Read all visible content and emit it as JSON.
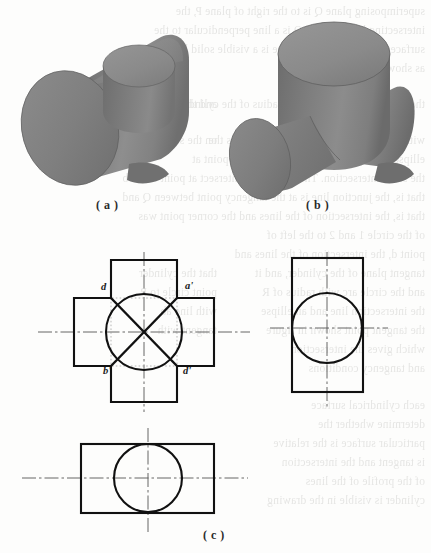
{
  "page": {
    "background_color": "#fdfdfc",
    "ink_color": "#1a1a1a",
    "bleed_text_color": "#6b6b66"
  },
  "figures": {
    "a": {
      "caption": "( a )",
      "description": "shaded-3d-solid-horizontal-cylinder-with-vertical-boss",
      "shading": {
        "top_face": "#8c8c8c",
        "light_side": "#939393",
        "mid_side": "#7d7d7d",
        "dark_side": "#6e6e6e",
        "edge": "#5f5f5f"
      }
    },
    "b": {
      "caption": "( b )",
      "description": "shaded-3d-solid-vertical-cylinder-with-through-horizontal-cylinder",
      "shading": {
        "top_face": "#8c8c8c",
        "light_side": "#939393",
        "mid_side": "#7d7d7d",
        "dark_side": "#6e6e6e",
        "edge": "#5f5f5f"
      }
    },
    "c": {
      "caption": "( c )",
      "description": "orthographic-three-view-projection-of-intersecting-cylinders",
      "views": {
        "front": {
          "name": "front-view-cross-shape-with-circle-and-intersection-curves",
          "point_labels": [
            {
              "text": "d",
              "x": 101,
              "y": 289
            },
            {
              "text": "a'",
              "x": 186,
              "y": 288
            },
            {
              "text": "b'",
              "x": 104,
              "y": 373
            },
            {
              "text": "d'",
              "x": 184,
              "y": 373
            }
          ]
        },
        "side": {
          "name": "side-view-rectangle-with-circle"
        },
        "top": {
          "name": "top-view-rectangle-with-circle"
        }
      }
    }
  },
  "bleed_lines": [
    {
      "x": 6,
      "y": 2,
      "text": "superimposing plane Q is to the right of plane P, the"
    },
    {
      "x": 6,
      "y": 21,
      "text": "intersecting line of P and Q is a line perpendicular to the"
    },
    {
      "x": 6,
      "y": 40,
      "text": "surface and the intersection line is a visible solid line"
    },
    {
      "x": 6,
      "y": 59,
      "text": "as shown in the projection."
    },
    {
      "x": 6,
      "y": 95,
      "text": "the plane P is the same as the radius of the cylinder"
    },
    {
      "x": 6,
      "y": 131,
      "text": "with R as radius and the junction curve is the"
    },
    {
      "x": 6,
      "y": 150,
      "text": "ellipse. With R as radius and the tangent point at"
    },
    {
      "x": 6,
      "y": 169,
      "text": "the same intersection. The two circles intersect at point d and b"
    },
    {
      "x": 6,
      "y": 188,
      "text": "that is, the junction line is at the tangency point between Q and"
    },
    {
      "x": 6,
      "y": 207,
      "text": "that is, the intersection of the lines and the corner point was"
    },
    {
      "x": 6,
      "y": 226,
      "text": "of the circle 1 and 2 to the left of"
    },
    {
      "x": 6,
      "y": 245,
      "text": "point d, the intersection of the lines and"
    },
    {
      "x": 6,
      "y": 264,
      "text": "tangent plane of the cylinder, and it"
    },
    {
      "x": 6,
      "y": 283,
      "text": "and the circle arc with radius of R"
    },
    {
      "x": 6,
      "y": 302,
      "text": "the intersection line and an ellipse"
    },
    {
      "x": 6,
      "y": 321,
      "text": "the tangent point shown in figure"
    },
    {
      "x": 6,
      "y": 340,
      "text": "which gives the intersection"
    },
    {
      "x": 6,
      "y": 359,
      "text": "and tangency conditions"
    },
    {
      "x": 6,
      "y": 396,
      "text": "each cylindrical surface"
    },
    {
      "x": 6,
      "y": 415,
      "text": "determine whether the"
    },
    {
      "x": 6,
      "y": 434,
      "text": "particular surface is the relative"
    },
    {
      "x": 6,
      "y": 453,
      "text": "is tangent and the intersection"
    },
    {
      "x": 6,
      "y": 472,
      "text": "of the profile of the lines"
    },
    {
      "x": 6,
      "y": 491,
      "text": "cylinder is visible in the drawing"
    },
    {
      "x": 214,
      "y": 95,
      "text": "and the radius of the"
    },
    {
      "x": 214,
      "y": 131,
      "text": "on the surface of"
    },
    {
      "x": 214,
      "y": 264,
      "text": "that the cylinder"
    },
    {
      "x": 214,
      "y": 283,
      "text": "point circle to P"
    },
    {
      "x": 214,
      "y": 302,
      "text": "with line ab"
    },
    {
      "x": 214,
      "y": 321,
      "text": "tangent with"
    }
  ]
}
